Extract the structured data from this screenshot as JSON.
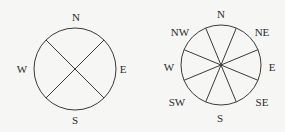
{
  "diagrams": [
    {
      "name": "four-direction-compass",
      "center": [
        75,
        69
      ],
      "radius": 41,
      "line_angles_deg": [
        45,
        135
      ],
      "labels": [
        {
          "text": "N",
          "x": 76,
          "y": 21
        },
        {
          "text": "W",
          "x": 22,
          "y": 73
        },
        {
          "text": "E",
          "x": 123,
          "y": 73
        },
        {
          "text": "S",
          "x": 75,
          "y": 124
        }
      ]
    },
    {
      "name": "eight-direction-compass",
      "center": [
        221,
        65
      ],
      "radius": 40,
      "line_angles_deg": [
        22.5,
        67.5,
        112.5,
        157.5
      ],
      "labels": [
        {
          "text": "N",
          "x": 221,
          "y": 18
        },
        {
          "text": "NW",
          "x": 180,
          "y": 36
        },
        {
          "text": "NE",
          "x": 262,
          "y": 36
        },
        {
          "text": "W",
          "x": 169,
          "y": 71
        },
        {
          "text": "E",
          "x": 272,
          "y": 71
        },
        {
          "text": "SW",
          "x": 177,
          "y": 106
        },
        {
          "text": "SE",
          "x": 262,
          "y": 106
        },
        {
          "text": "S",
          "x": 220,
          "y": 122
        }
      ]
    }
  ],
  "colors": {
    "background": "#f6f6f5",
    "stroke": "#3a3a3a",
    "text": "#2a2a2a"
  }
}
